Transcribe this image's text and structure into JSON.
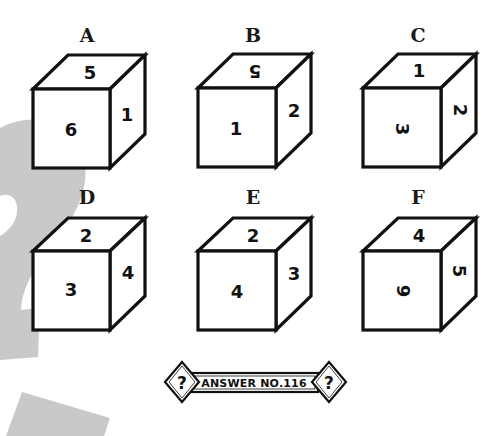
{
  "puzzle": {
    "watermark_color": "#c9c9c9",
    "line_color": "#111111",
    "cubes": [
      {
        "label": "A",
        "faces": {
          "top": {
            "value": "5",
            "rotation": 0
          },
          "front": {
            "value": "6",
            "rotation": 0
          },
          "right": {
            "value": "1",
            "rotation": 0
          }
        }
      },
      {
        "label": "B",
        "faces": {
          "top": {
            "value": "5",
            "rotation": 180
          },
          "front": {
            "value": "1",
            "rotation": 0
          },
          "right": {
            "value": "2",
            "rotation": 0
          }
        }
      },
      {
        "label": "C",
        "faces": {
          "top": {
            "value": "1",
            "rotation": 0
          },
          "front": {
            "value": "3",
            "rotation": 90
          },
          "right": {
            "value": "2",
            "rotation": 90
          }
        }
      },
      {
        "label": "D",
        "faces": {
          "top": {
            "value": "2",
            "rotation": 0
          },
          "front": {
            "value": "3",
            "rotation": 0
          },
          "right": {
            "value": "4",
            "rotation": 0
          }
        }
      },
      {
        "label": "E",
        "faces": {
          "top": {
            "value": "2",
            "rotation": 0
          },
          "front": {
            "value": "4",
            "rotation": 0
          },
          "right": {
            "value": "3",
            "rotation": 0
          }
        }
      },
      {
        "label": "F",
        "faces": {
          "top": {
            "value": "4",
            "rotation": 0
          },
          "front": {
            "value": "6",
            "rotation": -90
          },
          "right": {
            "value": "5",
            "rotation": 90
          }
        }
      }
    ]
  },
  "answer_badge": {
    "text": "ANSWER NO.116",
    "left_symbol": "?",
    "right_symbol": "?"
  }
}
